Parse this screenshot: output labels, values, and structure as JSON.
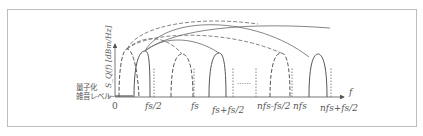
{
  "diagram": {
    "title": "",
    "y_axis_label": "S_Q(f) [dBm/Hz]",
    "x_axis_label": "f",
    "noise_label_line1": "量子化",
    "noise_label_line2": "雑音レベル",
    "ellipsis": "……",
    "tick_labels": {
      "zero": "0",
      "half_fs": "fs/2",
      "fs": "fs",
      "fs_plus_half": "fs+fs/2",
      "nfs_minus_half": "nfs-fs/2",
      "nfs": "nfs",
      "nfs_plus_half": "nfs+fs/2"
    },
    "colors": {
      "stroke": "#555555",
      "frame": "#bdbdbd",
      "background": "#ffffff"
    }
  }
}
